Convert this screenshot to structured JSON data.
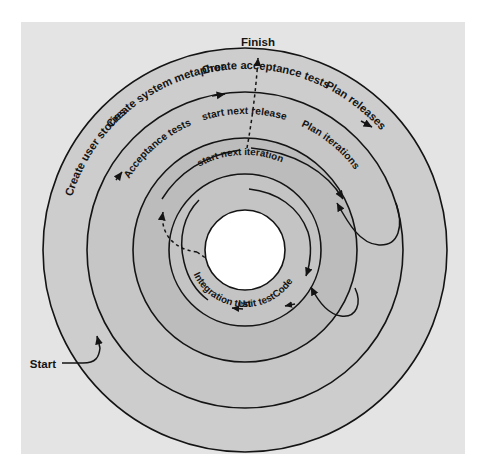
{
  "diagram": {
    "type": "concentric-spiral",
    "center": {
      "x": 245,
      "y": 250
    },
    "background_color": "#e4e4e4",
    "page_color": "#ffffff",
    "stroke_color": "#141414",
    "rings": [
      {
        "id": "outer",
        "radius": 202,
        "fill": "#cdcdcd",
        "label": "release-cycle-outer"
      },
      {
        "id": "ring2",
        "radius": 158,
        "fill": "#c6c6c6",
        "label": "release-cycle-inner"
      },
      {
        "id": "ring3",
        "radius": 112,
        "fill": "#bcbcbc",
        "label": "iteration-cycle-outer"
      },
      {
        "id": "ring4",
        "radius": 76,
        "fill": "#c4c4c4",
        "label": "iteration-cycle-inner"
      },
      {
        "id": "core",
        "radius": 40,
        "fill": "#ffffff",
        "label": "core"
      }
    ],
    "endpoints": {
      "start_label": "Start",
      "finish_label": "Finish"
    },
    "outer_ring_steps": [
      {
        "label": "Create user stories",
        "order": 1
      },
      {
        "label": "Create system metaphor",
        "order": 2
      },
      {
        "label": "Create acceptance tests",
        "order": 3
      },
      {
        "label": "Plan releases",
        "order": 4
      }
    ],
    "middle_ring_steps": [
      {
        "label": "start next release",
        "order": 1
      },
      {
        "label": "Acceptance tests",
        "order": 2
      },
      {
        "label": "Plan iterations",
        "order": 3
      }
    ],
    "inner_ring_steps": [
      {
        "label": "start next iteration",
        "order": 1
      },
      {
        "label": "Code",
        "order": 2
      },
      {
        "label": "Unit test",
        "order": 3
      },
      {
        "label": "Integration test",
        "order": 4
      }
    ],
    "connectors": [
      {
        "from": "Start",
        "to": "Create user stories",
        "style": "solid"
      },
      {
        "from": "Create user stories",
        "to": "Create system metaphor",
        "style": "arrowhead"
      },
      {
        "from": "Create system metaphor",
        "to": "Create acceptance tests",
        "style": "arrowhead"
      },
      {
        "from": "Create acceptance tests",
        "to": "Plan releases",
        "style": "arrowhead"
      },
      {
        "from": "Plan releases",
        "to": "Plan iterations",
        "style": "solid-spiral"
      },
      {
        "from": "Plan iterations",
        "to": "Code",
        "style": "solid-spiral"
      },
      {
        "from": "Code",
        "to": "Unit test",
        "style": "arrowhead"
      },
      {
        "from": "Unit test",
        "to": "Integration test",
        "style": "arrowhead"
      },
      {
        "from": "Integration test",
        "to": "Acceptance tests",
        "style": "dashed"
      },
      {
        "from": "Acceptance tests",
        "to": "start next release",
        "style": "dashed"
      },
      {
        "from": "start next release",
        "to": "Finish",
        "style": "dashed"
      },
      {
        "from": "start next iteration",
        "to": "Code",
        "style": "solid"
      }
    ]
  }
}
